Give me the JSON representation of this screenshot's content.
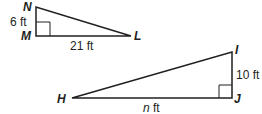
{
  "diagram": {
    "triangle_small": {
      "vertices": {
        "N": "N",
        "M": "M",
        "L": "L"
      },
      "side_NM": "6 ft",
      "side_ML": "21 ft",
      "right_angle_at": "M"
    },
    "triangle_large": {
      "vertices": {
        "I": "I",
        "J": "J",
        "H": "H"
      },
      "side_IJ": "10 ft",
      "side_HJ_var": "n",
      "side_HJ_unit": " ft",
      "right_angle_at": "J"
    },
    "colors": {
      "stroke": "#231f20"
    }
  }
}
